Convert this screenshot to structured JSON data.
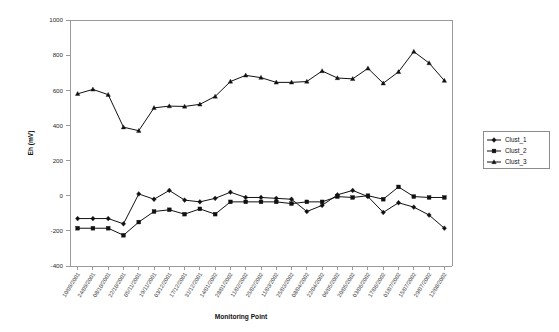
{
  "chart_data": {
    "type": "line",
    "title": "",
    "xlabel": "Monitoring Point",
    "ylabel": "Eh (mV)",
    "ylim": [
      -400,
      1000
    ],
    "ytick_step": 200,
    "yticks": [
      -400,
      -200,
      0,
      200,
      400,
      600,
      800,
      1000
    ],
    "grid": false,
    "legend_position": "right",
    "categories": [
      "10/09/2001",
      "24/09/2001",
      "08/10/2001",
      "22/10/2001",
      "05/11/2001",
      "19/11/2001",
      "03/12/2001",
      "17/12/2001",
      "31/12/2001",
      "14/01/2002",
      "28/01/2002",
      "11/02/2002",
      "25/02/2002",
      "11/03/2002",
      "25/03/2002",
      "08/04/2002",
      "22/04/2002",
      "06/05/2002",
      "20/05/2002",
      "03/06/2002",
      "17/06/2002",
      "01/07/2002",
      "15/07/2002",
      "29/07/2002",
      "12/08/2002"
    ],
    "series": [
      {
        "name": "Clust_1",
        "marker": "diamond",
        "values": [
          -130,
          -130,
          -130,
          -160,
          10,
          -20,
          30,
          -25,
          -35,
          -15,
          20,
          -10,
          -10,
          -15,
          -20,
          -90,
          -55,
          5,
          30,
          -5,
          -95,
          -40,
          -65,
          -110,
          -185
        ]
      },
      {
        "name": "Clust_2",
        "marker": "square",
        "values": [
          -185,
          -185,
          -185,
          -225,
          -150,
          -90,
          -80,
          -105,
          -75,
          -105,
          -35,
          -35,
          -35,
          -35,
          -45,
          -35,
          -35,
          -5,
          -10,
          0,
          -20,
          50,
          -5,
          -10,
          -10
        ]
      },
      {
        "name": "Clust_3",
        "marker": "triangle",
        "values": [
          580,
          605,
          575,
          390,
          370,
          500,
          510,
          508,
          520,
          565,
          650,
          685,
          672,
          645,
          645,
          650,
          710,
          670,
          665,
          725,
          640,
          705,
          820,
          755,
          655
        ]
      }
    ]
  },
  "legend": {
    "entries": [
      {
        "label": "Clust_1"
      },
      {
        "label": "Clust_2"
      },
      {
        "label": "Clust_3"
      }
    ]
  },
  "colors": {
    "series": "#111111",
    "axis": "#9a9a9a",
    "text": "#101010"
  }
}
